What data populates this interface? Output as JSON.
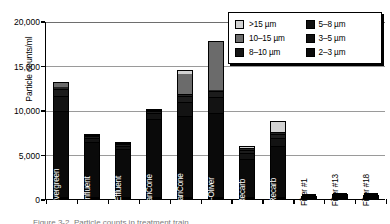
{
  "chart_data": {
    "type": "bar",
    "title": "",
    "xlabel": "",
    "ylabel": "Particle counts/ml",
    "ylim": [
      0,
      20000
    ],
    "yticks": [
      0,
      5000,
      10000,
      15000,
      20000
    ],
    "ytick_labels": [
      "0",
      "5,000",
      "10,000",
      "15,000",
      "20,000"
    ],
    "grid": true,
    "stacked": true,
    "legend_position": "top-right",
    "categories": [
      "Lake Evergreen",
      "RM Influent",
      "RM Effluent",
      "E. ClariCone",
      "W. ClariCone",
      "Dorr-Oliver",
      "E. Recarb",
      "W. Recarb",
      "Filter #1",
      "Filter #13",
      "Filter #18"
    ],
    "series": [
      {
        "name": "2-3 µm",
        "color": "#0a0a0a",
        "values": [
          9800,
          6500,
          5800,
          9100,
          9300,
          9600,
          4500,
          5900,
          230,
          430,
          380
        ]
      },
      {
        "name": "3-5 µm",
        "color": "#131313",
        "values": [
          1700,
          500,
          350,
          600,
          1500,
          1800,
          700,
          900,
          60,
          90,
          70
        ]
      },
      {
        "name": "5-8 µm",
        "color": "#1c1c1c",
        "values": [
          900,
          200,
          150,
          250,
          700,
          700,
          350,
          450,
          30,
          40,
          30
        ]
      },
      {
        "name": "8-10 µm",
        "color": "#242424",
        "values": [
          250,
          60,
          50,
          80,
          200,
          200,
          150,
          200,
          10,
          20,
          10
        ]
      },
      {
        "name": "10-15 µm",
        "color": "#6b6b6b",
        "values": [
          450,
          40,
          30,
          60,
          2500,
          5400,
          100,
          180,
          5,
          10,
          5
        ]
      },
      {
        "name": ">15 µm",
        "color": "#d2d2d2",
        "values": [
          0,
          20,
          20,
          40,
          300,
          0,
          200,
          1100,
          0,
          5,
          5
        ]
      }
    ],
    "totals": [
      13100,
      7320,
      6400,
      10130,
      14500,
      17700,
      6000,
      8730,
      335,
      595,
      500
    ]
  },
  "legend": {
    "entries": [
      {
        "label": ">15 µm",
        "color": "#d2d2d2"
      },
      {
        "label": "5–8 µm",
        "color": "#111111"
      },
      {
        "label": "10–15 µm",
        "color": "#6b6b6b"
      },
      {
        "label": "3–5 µm",
        "color": "#111111"
      },
      {
        "label": "8–10 µm",
        "color": "#141414"
      },
      {
        "label": "2–3 µm",
        "color": "#0a0a0a"
      }
    ]
  },
  "caption": "Figure 3-2.  Particle counts in treatment train"
}
